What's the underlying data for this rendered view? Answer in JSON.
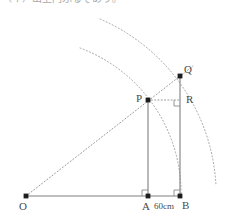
{
  "header": {
    "text": "（イ）出上円ふるそあり。"
  },
  "figure": {
    "colors": {
      "solid_line": "#7a7a7a",
      "dotted_line": "#9a9a9a",
      "point_fill": "#1a1a1a",
      "label_text": "#4a4a4a",
      "background": "#ffffff"
    },
    "points": [
      {
        "name": "O",
        "label": "O",
        "x": 26,
        "y": 196
      },
      {
        "name": "A",
        "label": "A",
        "x": 148,
        "y": 196
      },
      {
        "name": "B",
        "label": "B",
        "x": 180,
        "y": 196
      },
      {
        "name": "P",
        "label": "P",
        "x": 148,
        "y": 100
      },
      {
        "name": "Q",
        "label": "Q",
        "x": 180,
        "y": 76
      },
      {
        "name": "R",
        "label": "R",
        "x": 180,
        "y": 100
      }
    ],
    "segments": [
      {
        "name": "baseline-OB",
        "from": "O",
        "to": "B",
        "style": "solid"
      },
      {
        "name": "vertical-PA",
        "from": "P",
        "to": "A",
        "style": "solid"
      },
      {
        "name": "vertical-QB",
        "from": "Q",
        "to": "B",
        "style": "solid"
      },
      {
        "name": "ray-OPQ",
        "from": "O",
        "to": "Q",
        "style": "dotted"
      },
      {
        "name": "horizontal-PR",
        "from": "P",
        "to": "R",
        "style": "dotted"
      }
    ],
    "arcs": [
      {
        "name": "inner-arc-through-P-and-B",
        "center": "O",
        "radius": 155,
        "style": "dotted"
      },
      {
        "name": "outer-arc-through-Q",
        "center": "O",
        "radius": 192,
        "style": "dotted"
      }
    ],
    "right_angles": [
      {
        "name": "right-angle-at-A",
        "vertex": "A"
      },
      {
        "name": "right-angle-at-B",
        "vertex": "B"
      },
      {
        "name": "right-angle-at-R",
        "vertex": "R"
      }
    ],
    "dimensions": [
      {
        "name": "segment-AB-length",
        "label": "60cm",
        "from": "A",
        "to": "B"
      }
    ]
  }
}
